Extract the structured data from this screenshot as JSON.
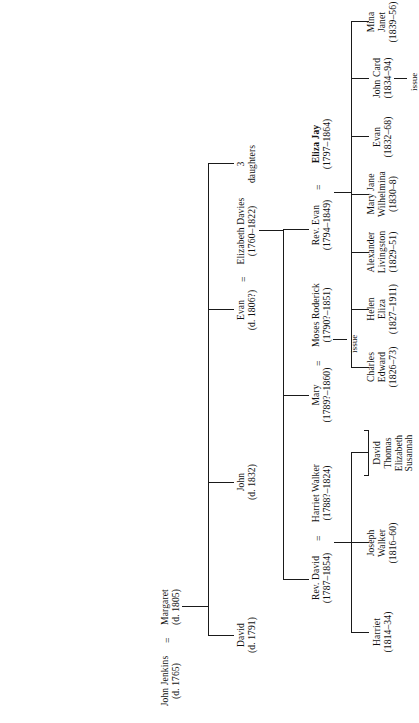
{
  "diagram": {
    "orientation": "rotated-90-ccw",
    "line_color": "#1a1a1a",
    "background": "#ffffff"
  },
  "symbols": {
    "marriage": "=",
    "issue": "issue"
  },
  "generation1": {
    "husband": {
      "name": "John Jenkins",
      "dates": "(d. 1765)"
    },
    "marriage_symbol": "=",
    "wife": {
      "name": "Margaret",
      "dates": "(d. 1805)"
    }
  },
  "generation2": [
    {
      "key": "david",
      "name": "David",
      "dates": "(d. 1791)"
    },
    {
      "key": "john",
      "name": "John",
      "dates": "(d. 1832)"
    },
    {
      "key": "evan",
      "name": "Evan",
      "dates": "(d. 1806?)",
      "marriage_symbol": "=",
      "spouse": {
        "name": "Elizabeth Davies",
        "dates": "(1760–1822)"
      }
    },
    {
      "key": "three-daughters",
      "name": "3",
      "dates": "daughters"
    }
  ],
  "generation3": [
    {
      "key": "rev-david",
      "name": "Rev. David",
      "dates": "(1787–1854)",
      "marriage_symbol": "=",
      "spouse": {
        "name": "Harriet Walker",
        "dates": "(1788?–1824)"
      }
    },
    {
      "key": "mary",
      "name": "Mary",
      "dates": "(1789?–1860)",
      "marriage_symbol": "=",
      "spouse": {
        "name": "Moses Roderick",
        "dates": "(1790?–1851)"
      },
      "issue": "issue"
    },
    {
      "key": "rev-evan",
      "name": "Rev. Evan",
      "dates": "(1794–1849)",
      "marriage_symbol": "=",
      "spouse": {
        "name": "Eliza Jay",
        "dates": "(1797–1864)",
        "bold": true
      }
    }
  ],
  "children_rev_david": [
    {
      "key": "harriet",
      "name": "Harriet",
      "dates": "(1814–34)"
    },
    {
      "key": "joseph-walker",
      "name": "Joseph\nWalker",
      "name_line1": "Joseph",
      "name_line2": "Walker",
      "dates": "(1816–60)"
    },
    {
      "key": "others",
      "names": [
        "David",
        "Thomas",
        "Elizabeth",
        "Susannah"
      ]
    }
  ],
  "children_rev_evan": [
    {
      "key": "charles-edward",
      "name_line1": "Charles",
      "name_line2": "Edward",
      "dates": "(1826–73)"
    },
    {
      "key": "helen-eliza",
      "name_line1": "Helen",
      "name_line2": "Eliza",
      "dates": "(1827–1911)"
    },
    {
      "key": "alexander-livingston",
      "name_line1": "Alexander",
      "name_line2": "Livingston",
      "dates": "(1829–51)"
    },
    {
      "key": "mary-jane-wilhelmina",
      "name_line1": "Mary Jane",
      "name_line2": "Wilhelmina",
      "dates": "(1830–8)"
    },
    {
      "key": "evan",
      "name_line1": "Evan",
      "name_line2": "",
      "dates": "(1832–68)"
    },
    {
      "key": "john-card",
      "name_line1": "John Card",
      "name_line2": "",
      "dates": "(1834–94)",
      "issue": "issue"
    },
    {
      "key": "mina-janet",
      "name_line1": "Mina",
      "name_line2": "Janet",
      "dates": "(1839–56)"
    }
  ]
}
